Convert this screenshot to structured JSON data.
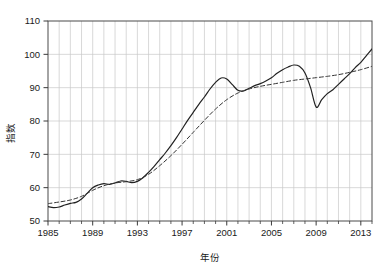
{
  "chart_data": {
    "type": "line",
    "title": "",
    "xlabel": "年份",
    "ylabel": "指数",
    "xlim": [
      1985,
      2014
    ],
    "ylim": [
      50,
      110
    ],
    "grid": true,
    "legend_position": "none",
    "x_major_ticks": [
      1985,
      1989,
      1993,
      1997,
      2001,
      2005,
      2009,
      2013
    ],
    "x_major_tick_labels": [
      "1985",
      "1989",
      "1993",
      "1997",
      "2001",
      "2005",
      "2009",
      "2013"
    ],
    "x_minor_tick_step": 1,
    "y_ticks": [
      50,
      60,
      70,
      80,
      90,
      100,
      110
    ],
    "y_tick_labels": [
      "50",
      "60",
      "70",
      "80",
      "90",
      "100",
      "110"
    ],
    "series": [
      {
        "name": "指数",
        "style": "solid",
        "color": "#222222",
        "x": [
          1985.0,
          1985.5,
          1986.0,
          1986.5,
          1987.0,
          1987.5,
          1988.0,
          1988.5,
          1989.0,
          1989.5,
          1990.0,
          1990.5,
          1991.0,
          1991.5,
          1992.0,
          1992.5,
          1993.0,
          1993.5,
          1994.0,
          1994.5,
          1995.0,
          1995.5,
          1996.0,
          1996.5,
          1997.0,
          1997.5,
          1998.0,
          1998.5,
          1999.0,
          1999.5,
          2000.0,
          2000.5,
          2001.0,
          2001.5,
          2002.0,
          2002.5,
          2003.0,
          2003.5,
          2004.0,
          2004.5,
          2005.0,
          2005.5,
          2006.0,
          2006.5,
          2007.0,
          2007.5,
          2008.0,
          2008.5,
          2009.0,
          2009.5,
          2010.0,
          2010.5,
          2011.0,
          2011.5,
          2012.0,
          2012.5,
          2013.0,
          2013.5,
          2014.0
        ],
        "y": [
          54.3,
          54.0,
          54.2,
          54.8,
          55.3,
          55.6,
          56.6,
          58.3,
          60.0,
          60.8,
          61.2,
          61.0,
          61.4,
          62.0,
          61.9,
          61.5,
          61.9,
          63.0,
          64.6,
          66.4,
          68.4,
          70.4,
          72.6,
          75.0,
          77.6,
          80.2,
          82.6,
          85.0,
          87.2,
          89.6,
          91.6,
          92.9,
          92.6,
          90.9,
          89.2,
          89.0,
          89.8,
          90.6,
          91.2,
          92.0,
          93.0,
          94.3,
          95.4,
          96.2,
          96.8,
          96.4,
          94.4,
          90.0,
          84.2,
          86.4,
          88.2,
          89.4,
          91.0,
          92.6,
          94.2,
          96.0,
          97.6,
          99.6,
          101.6
        ]
      },
      {
        "name": "趋势",
        "style": "dashed",
        "color": "#333333",
        "x": [
          1985.0,
          1986.0,
          1987.0,
          1988.0,
          1989.0,
          1990.0,
          1991.0,
          1992.0,
          1993.0,
          1994.0,
          1995.0,
          1996.0,
          1997.0,
          1998.0,
          1999.0,
          2000.0,
          2001.0,
          2002.0,
          2003.0,
          2004.0,
          2005.0,
          2006.0,
          2007.0,
          2008.0,
          2009.0,
          2010.0,
          2011.0,
          2012.0,
          2013.0,
          2014.0
        ],
        "y": [
          55.2,
          55.7,
          56.3,
          57.4,
          59.2,
          60.6,
          61.4,
          61.8,
          62.4,
          64.0,
          66.6,
          69.6,
          73.0,
          76.6,
          80.2,
          83.6,
          86.4,
          88.4,
          89.6,
          90.4,
          91.0,
          91.6,
          92.2,
          92.6,
          93.0,
          93.4,
          93.9,
          94.6,
          95.4,
          96.4
        ]
      }
    ]
  },
  "axis": {
    "y_label": "指数",
    "x_label": "年份"
  }
}
